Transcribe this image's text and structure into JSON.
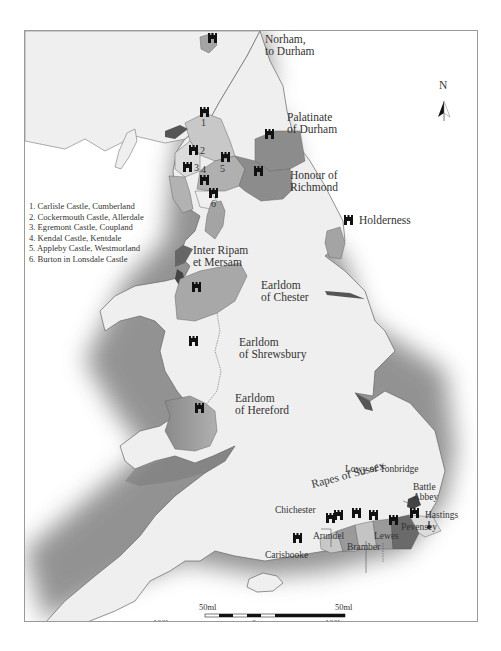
{
  "map": {
    "title": "Castles and lordships of Norman England",
    "north_arrow": {
      "label": "N",
      "icon": "north-arrow-icon"
    },
    "colors": {
      "land": "#efefef",
      "sea_shadow": "#6e6e6e",
      "region_light": "#c8c8c8",
      "region_mid": "#a4a4a4",
      "region_dark": "#6a6a6a",
      "castle": "#111111",
      "border": "#9a9a9a",
      "text": "#333333"
    },
    "labels": {
      "norham": "Norham,",
      "norham2": "to Durham",
      "palatinate": "Palatinate",
      "palatinate2": "of Durham",
      "richmond": "Honour of",
      "richmond2": "Richmond",
      "holderness": "Holderness",
      "inter_ripam": "Inter Ripam",
      "inter_ripam2": "et Mersam",
      "chester": "Earldom",
      "chester2": "of Chester",
      "shrewsbury": "Earldom",
      "shrewsbury2": "of Shrewsbury",
      "hereford": "Earldom",
      "hereford2": "of Hereford",
      "tonbridge": "Lowy of Tonbridge",
      "rapes": "Rapes of Sussex",
      "battle": "Battle",
      "battle2": "Abbey",
      "hastings": "Hastings",
      "pevensey": "Pevensey",
      "chichester": "Chichester",
      "arundel": "Arundel",
      "bramber": "Bramber",
      "lewes": "Lewes",
      "carisbrooke": "Carisbooke"
    },
    "numbers": [
      "1",
      "2",
      "3",
      "4",
      "5",
      "6"
    ],
    "legend": [
      "1. Carlisle Castle, Cumberland",
      "2. Cockermouth Castle, Allerdale",
      "3. Egremont Castle, Coupland",
      "4. Kendal Castle, Kentdale",
      "5. Appleby Castle, Westmorland",
      "6. Burton in Lonsdale Castle"
    ],
    "scale": {
      "miles_left": "50ml",
      "miles_right": "50ml",
      "km_left": "100km",
      "km_zero": "0",
      "km_right": "100km"
    }
  }
}
